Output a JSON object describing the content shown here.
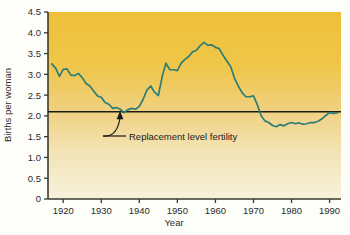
{
  "figure": {
    "background_color": "#fdfdfa",
    "plot_top_color": "#efc540",
    "plot_bottom_color": "#f6f1d6",
    "line_color": "#2e7d75",
    "reference_line_color": "#1c1c16",
    "axis_color": "#3a3a30"
  },
  "axes": {
    "y_title": "Births per woman",
    "x_title": "Year",
    "y_ticks": [
      "4.5",
      "4.0",
      "3.5",
      "3.0",
      "2.5",
      "2.0",
      "1.5",
      "1.0",
      "0.5",
      "0"
    ],
    "x_ticks": [
      "1920",
      "1930",
      "1940",
      "1950",
      "1960",
      "1970",
      "1980",
      "1990"
    ]
  },
  "annotations": {
    "replacement_label": "Replacement level fertility"
  },
  "chart_data": {
    "type": "line",
    "title": "",
    "xlabel": "Year",
    "ylabel": "Births per woman",
    "xlim": [
      1916,
      1993
    ],
    "ylim": [
      0,
      4.5
    ],
    "grid": false,
    "legend": "none",
    "y_ticks": [
      0,
      0.5,
      1.0,
      1.5,
      2.0,
      2.5,
      3.0,
      3.5,
      4.0,
      4.5
    ],
    "x_ticks": [
      1920,
      1930,
      1940,
      1950,
      1960,
      1970,
      1980,
      1990
    ],
    "reference_lines": [
      {
        "label": "Replacement level fertility",
        "y": 2.1,
        "orientation": "horizontal",
        "color": "#1c1c16"
      }
    ],
    "series": [
      {
        "name": "Total fertility rate",
        "color": "#2e7d75",
        "x": [
          1917,
          1918,
          1919,
          1920,
          1921,
          1922,
          1923,
          1924,
          1925,
          1926,
          1927,
          1928,
          1929,
          1930,
          1931,
          1932,
          1933,
          1934,
          1935,
          1936,
          1937,
          1938,
          1939,
          1940,
          1941,
          1942,
          1943,
          1944,
          1945,
          1946,
          1947,
          1948,
          1949,
          1950,
          1951,
          1952,
          1953,
          1954,
          1955,
          1956,
          1957,
          1958,
          1959,
          1960,
          1961,
          1962,
          1963,
          1964,
          1965,
          1966,
          1967,
          1968,
          1969,
          1970,
          1971,
          1972,
          1973,
          1974,
          1975,
          1976,
          1977,
          1978,
          1979,
          1980,
          1981,
          1982,
          1983,
          1984,
          1985,
          1986,
          1987,
          1988,
          1989,
          1990,
          1991,
          1992
        ],
        "y": [
          3.25,
          3.15,
          2.95,
          3.12,
          3.13,
          2.98,
          2.97,
          3.02,
          2.92,
          2.78,
          2.72,
          2.6,
          2.48,
          2.45,
          2.32,
          2.28,
          2.18,
          2.2,
          2.16,
          2.08,
          2.15,
          2.18,
          2.16,
          2.23,
          2.4,
          2.62,
          2.72,
          2.57,
          2.49,
          2.94,
          3.27,
          3.11,
          3.11,
          3.09,
          3.27,
          3.36,
          3.43,
          3.54,
          3.58,
          3.69,
          3.77,
          3.7,
          3.71,
          3.65,
          3.62,
          3.46,
          3.32,
          3.19,
          2.91,
          2.72,
          2.56,
          2.46,
          2.46,
          2.48,
          2.27,
          2.01,
          1.88,
          1.84,
          1.77,
          1.74,
          1.79,
          1.76,
          1.81,
          1.84,
          1.81,
          1.83,
          1.8,
          1.81,
          1.84,
          1.84,
          1.87,
          1.93,
          2.01,
          2.08,
          2.06,
          2.07
        ]
      }
    ]
  }
}
